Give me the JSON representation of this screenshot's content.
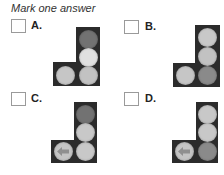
{
  "question": {
    "prompt": "Mark one answer"
  },
  "colors": {
    "housing": "#2b2b2b",
    "lamp_dim": "#727272",
    "lamp_dimmer": "#8a8a8a",
    "lamp_light": "#c6c6c6",
    "lamp_bright": "#e0e0e0",
    "arrow": "#8f8f8f",
    "checkbox_border": "#9a9a9a"
  },
  "options": [
    {
      "id": "A",
      "label": "A.",
      "checked": false,
      "signal": {
        "lamps": {
          "top": {
            "state": "dim",
            "color": "#727272"
          },
          "middle": {
            "state": "lit",
            "color": "#e0e0e0"
          },
          "bottom_right": {
            "state": "light",
            "color": "#c2c2c2"
          },
          "bottom_left": {
            "state": "light",
            "color": "#c6c6c6",
            "arrow": false
          }
        }
      }
    },
    {
      "id": "B",
      "label": "B.",
      "checked": false,
      "signal": {
        "lamps": {
          "top": {
            "state": "light",
            "color": "#c8c8c8"
          },
          "middle": {
            "state": "light",
            "color": "#c2c2c2"
          },
          "bottom_right": {
            "state": "dim",
            "color": "#8a8a8a"
          },
          "bottom_left": {
            "state": "light",
            "color": "#c6c6c6",
            "arrow": false
          }
        }
      }
    },
    {
      "id": "C",
      "label": "C.",
      "checked": false,
      "signal": {
        "lamps": {
          "top": {
            "state": "dim",
            "color": "#727272"
          },
          "middle": {
            "state": "light",
            "color": "#c8c8c8"
          },
          "bottom_right": {
            "state": "light",
            "color": "#c8c8c8"
          },
          "bottom_left": {
            "state": "light",
            "color": "#c4c4c4",
            "arrow": true,
            "arrow_direction": "left"
          }
        }
      }
    },
    {
      "id": "D",
      "label": "D.",
      "checked": false,
      "signal": {
        "lamps": {
          "top": {
            "state": "light",
            "color": "#c8c8c8"
          },
          "middle": {
            "state": "light",
            "color": "#c8c8c8"
          },
          "bottom_right": {
            "state": "dim",
            "color": "#8a8a8a"
          },
          "bottom_left": {
            "state": "light",
            "color": "#c4c4c4",
            "arrow": true,
            "arrow_direction": "left"
          }
        }
      }
    }
  ]
}
